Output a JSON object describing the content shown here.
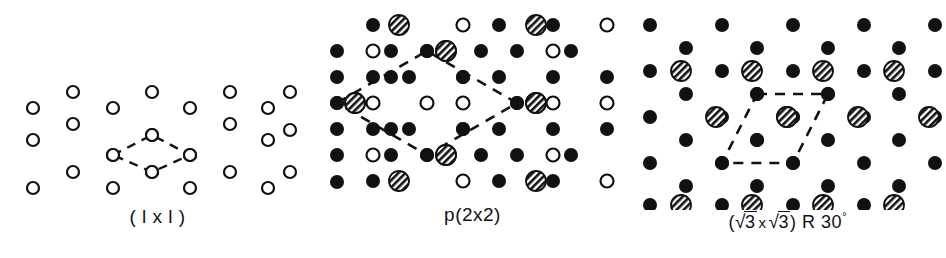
{
  "figure": {
    "type": "crystallography-surface-lattice-diagram",
    "background_color": "#ffffff",
    "ink_color": "#111111",
    "panel_count": 3
  },
  "panels": [
    {
      "id": "1x1",
      "caption": "( l x l )",
      "caption_parts": {
        "open": "(",
        "a": "l",
        "x": "x",
        "b": "l",
        "close": ")"
      },
      "unit_cell_shape": "rhombus",
      "unit_cell_line_style": "dashed",
      "legend": {
        "open-circle": "substrate atom (unreconstructed surface)"
      },
      "lattice": {
        "type": "hexagonal",
        "column_spacing_px": 40,
        "row_spacing_px": 31,
        "marker_style": "open-circle",
        "marker_radius_px": 6
      }
    },
    {
      "id": "p2x2",
      "caption": "p(2x2)",
      "caption_parts": {
        "prefix": "p",
        "open": "(",
        "a": "2",
        "x": "x",
        "b": "2",
        "close": ")"
      },
      "unit_cell_shape": "rhombus",
      "unit_cell_line_style": "dashed",
      "legend": {
        "filled-circle": "substrate atom",
        "hatched-circle": "adsorbate atom",
        "open-circle": "vacant/second-layer site"
      },
      "lattice": {
        "type": "hexagonal",
        "column_spacing_px": 36,
        "row_spacing_px": 26,
        "filled_marker_radius_px": 7,
        "hatched_marker_radius_px": 10,
        "open_marker_radius_px": 7
      }
    },
    {
      "id": "r30",
      "caption": "(√3 x √3) R 30°",
      "caption_parts": {
        "open": "(",
        "radical_a": "√",
        "num_a": "3",
        "x": "x",
        "radical_b": "√",
        "num_b": "3",
        "close": ")",
        "rotation_label": "R",
        "rotation_value": "30",
        "degree": "°"
      },
      "unit_cell_shape": "parallelogram",
      "unit_cell_line_style": "dashed",
      "unit_cell_rotation_deg": 30,
      "legend": {
        "filled-circle": "substrate atom",
        "hatched-circle": "adsorbate atom"
      },
      "lattice": {
        "type": "hexagonal",
        "column_spacing_px": 36,
        "row_spacing_px": 26,
        "filled_marker_radius_px": 7,
        "hatched_marker_radius_px": 10
      }
    }
  ],
  "markers": {
    "open_circle": {
      "fill": "#ffffff",
      "stroke": "#111111",
      "stroke_width": 2.2
    },
    "filled_circle": {
      "fill": "#111111",
      "stroke": "#111111"
    },
    "hatched_circle": {
      "fill": "diagonal-hatch",
      "stroke": "#111111",
      "stroke_width": 1.8,
      "hatch_angle_deg": 45
    }
  }
}
